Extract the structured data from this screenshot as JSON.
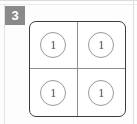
{
  "badge": {
    "label": "3",
    "background_color": "#8a8a8a",
    "text_color": "#ffffff"
  },
  "grid": {
    "rows": 2,
    "columns": 2,
    "border_color": "#3c3c3c",
    "divider_color": "#8e8e8e",
    "token_border_color": "#9a9a9a",
    "token_text_color": "#4a4a4a",
    "cells": [
      {
        "value": "1"
      },
      {
        "value": "1"
      },
      {
        "value": "1"
      },
      {
        "value": "1"
      }
    ]
  },
  "canvas": {
    "background_color": "#fdfdfd",
    "edge_line_color": "#dcdcdc"
  }
}
